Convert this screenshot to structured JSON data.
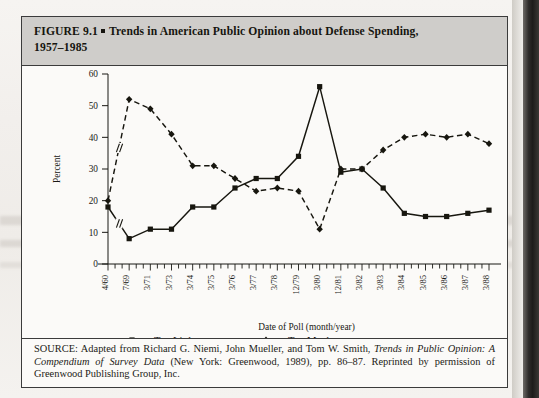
{
  "figure": {
    "label": "FIGURE 9.1",
    "bullet": "■",
    "title_line1": "Trends in American Public Opinion about Defense Spending,",
    "title_line2": "1957–1985"
  },
  "source": {
    "prefix": "SOURCE:",
    "text_a": " Adapted from Richard G. Niemi, John Mueller, and Tom W. Smith, ",
    "italic_a": "Trends in Public Opinion: A Compendium of Survey Data",
    "text_b": " (New York: Greenwood, 1989), pp. 86–87. Reprinted by permission of Greenwood Publishing Group, Inc."
  },
  "axes": {
    "ylabel": "Percent",
    "xlabel": "Date of Poll (month/year)",
    "yticks": [
      "0",
      "10",
      "20",
      "30",
      "40",
      "50",
      "60"
    ],
    "ylim": [
      0,
      60
    ],
    "break_marker": "//"
  },
  "legend": {
    "items": [
      {
        "label": "Too Little",
        "marker": "square",
        "style": "solid",
        "color": "#17160f"
      },
      {
        "label": "Too Much",
        "marker": "diamond",
        "style": "dashed",
        "color": "#17160f"
      }
    ]
  },
  "chart_data": {
    "type": "line",
    "title": "Trends in American Public Opinion about Defense Spending, 1957–1985",
    "xlabel": "Date of Poll (month/year)",
    "ylabel": "Percent",
    "ylim": [
      0,
      60
    ],
    "grid": false,
    "legend_position": "bottom",
    "axis_break_after_index": 0,
    "categories": [
      "4/60",
      "7/69",
      "3/71",
      "3/73",
      "3/74",
      "3/75",
      "3/76",
      "3/77",
      "3/78",
      "12/79",
      "3/80",
      "12/81",
      "3/82",
      "3/83",
      "3/84",
      "3/85",
      "3/86",
      "3/87",
      "3/88"
    ],
    "series": [
      {
        "name": "Too Little",
        "marker": "square",
        "style": "solid",
        "values": [
          18,
          8,
          11,
          11,
          18,
          18,
          24,
          27,
          27,
          34,
          56,
          29,
          30,
          24,
          16,
          15,
          15,
          16,
          17
        ]
      },
      {
        "name": "Too Much",
        "marker": "diamond",
        "style": "dashed",
        "values": [
          20,
          52,
          49,
          41,
          31,
          31,
          27,
          23,
          24,
          23,
          11,
          30,
          30,
          36,
          40,
          41,
          40,
          41,
          38
        ]
      }
    ]
  }
}
